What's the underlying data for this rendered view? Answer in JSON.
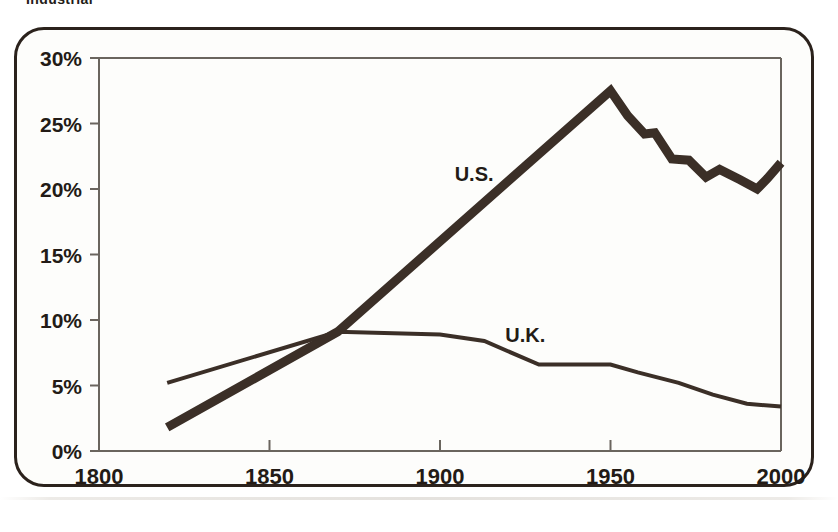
{
  "figure": {
    "clipped_heading": "Industrial",
    "frame_color": "#2b221c",
    "ink_color": "#3b2f27",
    "axis_color": "#6a655e",
    "background": "#fdfdfb"
  },
  "chart_data": {
    "type": "line",
    "title": "",
    "xlabel": "",
    "ylabel": "",
    "xlim": [
      1800,
      2000
    ],
    "ylim": [
      0,
      30
    ],
    "grid": false,
    "legend_position": "inline-annotation",
    "x_ticks": [
      "1800",
      "1850",
      "1900",
      "1950",
      "2000"
    ],
    "x_tick_values": [
      1800,
      1850,
      1900,
      1950,
      2000
    ],
    "y_ticks": [
      "0%",
      "5%",
      "10%",
      "15%",
      "20%",
      "25%",
      "30%"
    ],
    "y_tick_values": [
      0,
      5,
      10,
      15,
      20,
      25,
      30
    ],
    "series": [
      {
        "name": "U.S.",
        "label": "U.S.",
        "style": "thick",
        "line_width": 9,
        "label_x": 1910,
        "label_y": 20.6,
        "x": [
          1820,
          1870,
          1950,
          1955,
          1960,
          1963,
          1968,
          1973,
          1978,
          1982,
          1988,
          1993,
          1996,
          2000
        ],
        "values": [
          1.8,
          9.1,
          27.5,
          25.6,
          24.2,
          24.3,
          22.3,
          22.2,
          20.9,
          21.5,
          20.7,
          20.0,
          20.8,
          22.0
        ]
      },
      {
        "name": "U.K.",
        "label": "U.K.",
        "style": "thin",
        "line_width": 4,
        "label_x": 1925,
        "label_y": 8.3,
        "x": [
          1820,
          1870,
          1900,
          1913,
          1929,
          1938,
          1950,
          1958,
          1970,
          1980,
          1990,
          2000
        ],
        "values": [
          5.2,
          9.1,
          8.9,
          8.4,
          6.6,
          6.6,
          6.6,
          6.0,
          5.2,
          4.3,
          3.6,
          3.4
        ]
      }
    ]
  }
}
